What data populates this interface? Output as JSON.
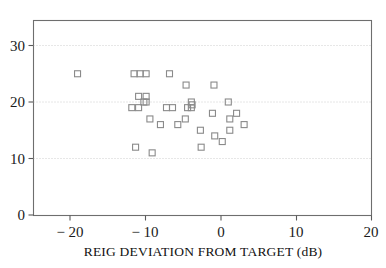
{
  "chart_data": {
    "type": "scatter",
    "title": "",
    "subtitle": "",
    "xlabel": "REIG DEVIATION FROM TARGET (dB)",
    "ylabel": "",
    "xlim": [
      -24,
      20
    ],
    "ylim": [
      0,
      34
    ],
    "xticks": [
      -20,
      -10,
      0,
      10,
      20
    ],
    "xticklabels": [
      "− 20",
      "− 10",
      "0",
      "10",
      "20"
    ],
    "yticks": [
      0,
      10,
      20,
      30
    ],
    "yticklabels": [
      "0",
      "10",
      "20",
      "30"
    ],
    "grid": "horizontal-dotted",
    "legend": "none",
    "marker": "open-square",
    "marker_color": "#8a8a8a",
    "frame_color": "#6e6e6e",
    "grid_color": "#c8c8c8",
    "points": [
      {
        "x": -19,
        "y": 25
      },
      {
        "x": -11.5,
        "y": 25
      },
      {
        "x": -10.7,
        "y": 25
      },
      {
        "x": -9.9,
        "y": 25
      },
      {
        "x": -6.8,
        "y": 25
      },
      {
        "x": -4.6,
        "y": 23
      },
      {
        "x": -0.9,
        "y": 23
      },
      {
        "x": -10.9,
        "y": 21
      },
      {
        "x": -9.9,
        "y": 21
      },
      {
        "x": -10.2,
        "y": 20
      },
      {
        "x": -9.9,
        "y": 20
      },
      {
        "x": -3.9,
        "y": 20
      },
      {
        "x": -3.8,
        "y": 19.5
      },
      {
        "x": 1.0,
        "y": 20
      },
      {
        "x": -11.8,
        "y": 19
      },
      {
        "x": -10.9,
        "y": 19
      },
      {
        "x": -7.2,
        "y": 19
      },
      {
        "x": -6.4,
        "y": 19
      },
      {
        "x": -4.4,
        "y": 19
      },
      {
        "x": -3.9,
        "y": 19
      },
      {
        "x": -1.1,
        "y": 18
      },
      {
        "x": 2.1,
        "y": 18
      },
      {
        "x": -9.4,
        "y": 17
      },
      {
        "x": -4.7,
        "y": 17
      },
      {
        "x": 1.2,
        "y": 17
      },
      {
        "x": -8.0,
        "y": 16
      },
      {
        "x": -5.7,
        "y": 16
      },
      {
        "x": 3.1,
        "y": 16
      },
      {
        "x": -2.7,
        "y": 15
      },
      {
        "x": 1.2,
        "y": 15
      },
      {
        "x": -0.8,
        "y": 14
      },
      {
        "x": 0.2,
        "y": 13
      },
      {
        "x": -11.3,
        "y": 12
      },
      {
        "x": -2.6,
        "y": 12
      },
      {
        "x": -9.1,
        "y": 11
      }
    ]
  }
}
